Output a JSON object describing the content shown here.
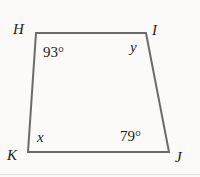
{
  "figure": {
    "type": "quadrilateral",
    "name": "quadrilateral-HIJK",
    "stroke_color": "#6b6b6e",
    "stroke_width": 2,
    "background_color": "#fbfaf8",
    "text_color": "#1b1b1b",
    "vertices": [
      {
        "id": "H",
        "label": "H",
        "x": 36,
        "y": 33,
        "position": "top-left"
      },
      {
        "id": "I",
        "label": "I",
        "x": 146,
        "y": 33,
        "position": "top-right"
      },
      {
        "id": "J",
        "label": "J",
        "x": 169,
        "y": 152,
        "position": "bottom-right"
      },
      {
        "id": "K",
        "label": "K",
        "x": 28,
        "y": 152,
        "position": "bottom-left"
      }
    ],
    "polygon_points": "36,33 146,33 169,152 28,152",
    "interior_labels": [
      {
        "id": "angle-H",
        "text": "93°",
        "at_vertex": "H",
        "kind": "measure"
      },
      {
        "id": "angle-I",
        "text": "y",
        "at_vertex": "I",
        "kind": "variable"
      },
      {
        "id": "angle-J",
        "text": "79°",
        "at_vertex": "J",
        "kind": "measure"
      },
      {
        "id": "angle-K",
        "text": "x",
        "at_vertex": "K",
        "kind": "variable"
      }
    ]
  }
}
